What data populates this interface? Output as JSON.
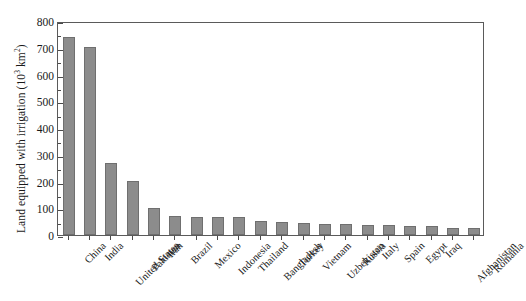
{
  "chart_data": {
    "type": "bar",
    "title": "",
    "subtitle": "",
    "xlabel": "",
    "ylabel": "Land equipped with irrigation (10",
    "ylabel_exponent": "3",
    "ylabel_unit": " km",
    "ylabel_unit_exponent": "2",
    "ylabel_close": ")",
    "ylabel_full": "Land equipped with irrigation (10³ km²)",
    "ylim": [
      0,
      800
    ],
    "ytick_values": [
      0,
      100,
      200,
      300,
      400,
      500,
      600,
      700,
      800
    ],
    "ytick_labels": [
      "0",
      "100",
      "200",
      "300",
      "400",
      "500",
      "600",
      "700",
      "800"
    ],
    "ytick_minor_step": 50,
    "grid": false,
    "legend": false,
    "legend_position": "none",
    "bar_color": "#8c8c8c",
    "bar_edge_color": "#6f6f6f",
    "frame_color": "#5a5a5a",
    "categories": [
      "China",
      "India",
      "United States",
      "Pakistan",
      "Iran",
      "Brazil",
      "Mexico",
      "Indonesia",
      "Thailand",
      "Bangladesh",
      "Turkey",
      "Vietnam",
      "Uzbekistan",
      "Russia",
      "Italy",
      "Spain",
      "Egypt",
      "Iraq",
      "Afghanistan",
      "Romania"
    ],
    "values": [
      742,
      703,
      268,
      202,
      100,
      72,
      68,
      67,
      66,
      54,
      50,
      46,
      42,
      41,
      39,
      37,
      34,
      33,
      28,
      26
    ]
  }
}
